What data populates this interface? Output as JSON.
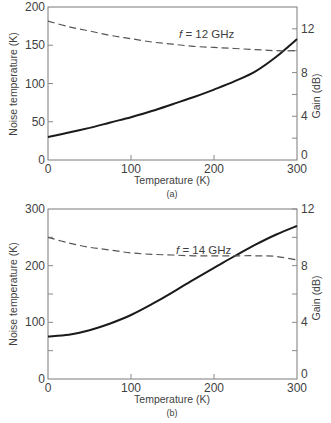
{
  "chart_data": [
    {
      "type": "line",
      "panel_label": "(a)",
      "annotation": "f = 12 GHz",
      "annotation_parts": {
        "var": "f",
        "rest": " = 12 GHz"
      },
      "xlabel": "Temperature (K)",
      "ylabel": "Noise temperature (K)",
      "y2label": "Gain (dB)",
      "xlim": [
        0,
        300
      ],
      "ylim": [
        0,
        200
      ],
      "y2lim": [
        0,
        14
      ],
      "x_ticks": [
        0,
        100,
        200,
        300
      ],
      "y_ticks": [
        0,
        50,
        100,
        150,
        200
      ],
      "y2_ticks": [
        0,
        4,
        8,
        12
      ],
      "y2_minor_ticks": [
        2,
        6,
        10
      ],
      "grid": false,
      "x": [
        0,
        25,
        50,
        75,
        100,
        125,
        150,
        175,
        200,
        225,
        250,
        275,
        300
      ],
      "series": [
        {
          "name": "Noise temperature",
          "axis": "left",
          "style": "solid",
          "values": [
            30,
            36,
            42,
            49,
            56,
            64,
            73,
            82,
            92,
            103,
            116,
            135,
            158
          ]
        },
        {
          "name": "Gain",
          "axis": "right",
          "style": "dashed",
          "values": [
            12.7,
            12.2,
            11.8,
            11.4,
            11.1,
            10.8,
            10.6,
            10.4,
            10.3,
            10.2,
            10.1,
            10.0,
            10.0
          ]
        }
      ]
    },
    {
      "type": "line",
      "panel_label": "(b)",
      "annotation": "f = 14 GHz",
      "annotation_parts": {
        "var": "f",
        "rest": " = 14 GHz"
      },
      "xlabel": "Temperature (K)",
      "ylabel": "Noise temperature (K)",
      "y2label": "Gain (dB)",
      "xlim": [
        0,
        300
      ],
      "ylim": [
        0,
        300
      ],
      "y2lim": [
        0,
        12
      ],
      "x_ticks": [
        0,
        100,
        200,
        300
      ],
      "y_ticks": [
        0,
        100,
        200,
        300
      ],
      "y_minor_ticks": [
        50,
        150,
        250
      ],
      "y2_ticks": [
        0,
        4,
        8,
        12
      ],
      "y2_minor_ticks": [
        2,
        6,
        10
      ],
      "grid": false,
      "x": [
        0,
        25,
        50,
        75,
        100,
        125,
        150,
        175,
        200,
        225,
        250,
        275,
        300
      ],
      "series": [
        {
          "name": "Noise temperature",
          "axis": "left",
          "style": "solid",
          "values": [
            75,
            78,
            86,
            98,
            113,
            132,
            153,
            175,
            196,
            217,
            237,
            255,
            270
          ]
        },
        {
          "name": "Gain",
          "axis": "right",
          "style": "dashed",
          "values": [
            10.0,
            9.6,
            9.3,
            9.1,
            8.9,
            8.8,
            8.75,
            8.7,
            8.7,
            8.7,
            8.7,
            8.65,
            8.4
          ]
        }
      ]
    }
  ]
}
